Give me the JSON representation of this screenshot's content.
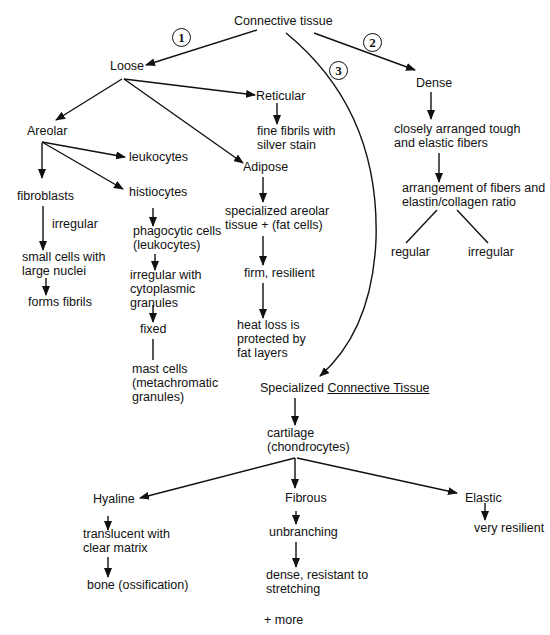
{
  "diagram": {
    "root": "Connective tissue",
    "branch_numbers": [
      "1",
      "2",
      "3"
    ],
    "loose": {
      "label": "Loose",
      "areolar": {
        "label": "Areolar",
        "leukocytes": "leukocytes",
        "fibroblasts": {
          "label": "fibroblasts",
          "edge_label": "irregular",
          "small_cells": [
            "small cells with",
            "large nuclei"
          ],
          "forms_fibrils": "forms fibrils"
        },
        "histiocytes": {
          "label": "histiocytes",
          "phagocytic": [
            "phagocytic cells",
            "(leukocytes)"
          ],
          "irregular_granules": [
            "irregular with",
            "cytoplasmic",
            "granules"
          ],
          "fixed": "fixed",
          "mast_cells": [
            "mast cells",
            "(metachromatic",
            "granules)"
          ]
        }
      },
      "reticular": {
        "label": "Reticular",
        "desc": [
          "fine fibrils with",
          "silver stain"
        ]
      },
      "adipose": {
        "label": "Adipose",
        "specialized": [
          "specialized areolar",
          "tissue + (fat cells)"
        ],
        "firm": "firm, resilient",
        "heat_loss": [
          "heat loss is",
          "protected by",
          "fat layers"
        ]
      }
    },
    "dense": {
      "label": "Dense",
      "desc": [
        "closely arranged tough",
        "and elastic fibers"
      ],
      "arrangement": [
        "arrangement of fibers and",
        "elastin/collagen ratio"
      ],
      "regular": "regular",
      "irregular": "irregular"
    },
    "specialized": {
      "prefix": "Specialized ",
      "underlined": "Connective Tissue",
      "cartilage": [
        "cartilage",
        "(chondrocytes)"
      ],
      "hyaline": {
        "label": "Hyaline",
        "desc": [
          "translucent with",
          "clear matrix"
        ],
        "bone": "bone (ossification)"
      },
      "fibrous": {
        "label": "Fibrous",
        "unbranching": "unbranching",
        "dense": [
          "dense, resistant to",
          "stretching"
        ]
      },
      "elastic": {
        "label": "Elastic",
        "desc": "very resilient"
      },
      "more": "+ more"
    }
  }
}
